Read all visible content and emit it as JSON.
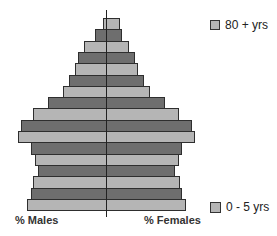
{
  "chart_data": {
    "type": "bar",
    "subtype": "population-pyramid",
    "title": "",
    "xlabel_left": "% Males",
    "xlabel_right": "% Females",
    "categories_top_to_bottom": [
      "80 + yrs",
      "",
      "",
      "",
      "",
      "",
      "",
      "",
      "",
      "",
      "",
      "",
      "",
      "",
      "",
      "",
      "0 - 5 yrs"
    ],
    "note": "Bar widths measured in pixels from center axis (no numeric scale shown)",
    "series": [
      {
        "name": "Males",
        "values_px": [
          3,
          11,
          22,
          28,
          31,
          37,
          43,
          58,
          73,
          85,
          88,
          75,
          71,
          68,
          73,
          75,
          79
        ]
      },
      {
        "name": "Females",
        "values_px": [
          13,
          15,
          22,
          28,
          31,
          37,
          43,
          58,
          72,
          85,
          88,
          75,
          72,
          68,
          73,
          75,
          79
        ]
      }
    ],
    "fill_pattern": [
      "light",
      "dark"
    ],
    "colors": {
      "light": "#b5b5b5",
      "dark": "#6e6e6e",
      "border": "#2e2e2e"
    },
    "grid": false
  },
  "legend": {
    "top": "80 + yrs",
    "bottom": "0 - 5 yrs"
  },
  "labels": {
    "males": "% Males",
    "females": "% Females"
  },
  "layout": {
    "axis_x": 106,
    "top_y": 18,
    "bar_height": 11.3
  }
}
